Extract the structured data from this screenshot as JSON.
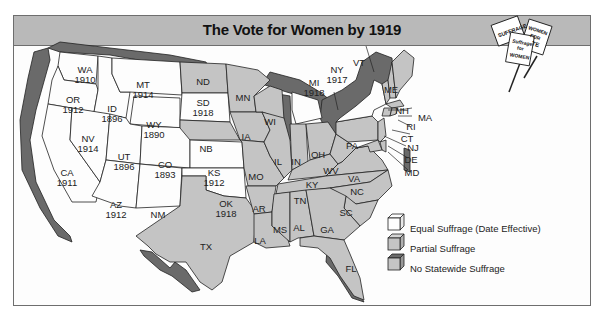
{
  "title": "The Vote for Women by 1919",
  "colors": {
    "equal": "#fdfdfd",
    "partial": "#c4c4c4",
    "none": "#6a6a6a",
    "title_bar": "#b9b9b9",
    "border": "#6e6e6e"
  },
  "signs": [
    "SUFFRAGE",
    "WOMEN FOR VOTE",
    "Suffrage for WOMEN"
  ],
  "legend": [
    {
      "key": "equal",
      "label": "Equal Suffrage (Date Effective)"
    },
    {
      "key": "partial",
      "label": "Partial Suffrage"
    },
    {
      "key": "none",
      "label": "No Statewide Suffrage"
    }
  ],
  "states": [
    {
      "abbr": "WA",
      "year": "1910",
      "status": "equal"
    },
    {
      "abbr": "OR",
      "year": "1912",
      "status": "equal"
    },
    {
      "abbr": "CA",
      "year": "1911",
      "status": "equal"
    },
    {
      "abbr": "ID",
      "year": "1896",
      "status": "equal"
    },
    {
      "abbr": "NV",
      "year": "1914",
      "status": "equal"
    },
    {
      "abbr": "MT",
      "year": "1914",
      "status": "equal"
    },
    {
      "abbr": "WY",
      "year": "1890",
      "status": "equal"
    },
    {
      "abbr": "UT",
      "year": "1896",
      "status": "equal"
    },
    {
      "abbr": "CO",
      "year": "1893",
      "status": "equal"
    },
    {
      "abbr": "AZ",
      "year": "1912",
      "status": "equal"
    },
    {
      "abbr": "NM",
      "year": "",
      "status": "partial"
    },
    {
      "abbr": "ND",
      "year": "",
      "status": "partial"
    },
    {
      "abbr": "SD",
      "year": "1918",
      "status": "equal"
    },
    {
      "abbr": "NB",
      "year": "",
      "status": "partial"
    },
    {
      "abbr": "KS",
      "year": "1912",
      "status": "equal"
    },
    {
      "abbr": "OK",
      "year": "1918",
      "status": "equal"
    },
    {
      "abbr": "TX",
      "year": "",
      "status": "partial"
    },
    {
      "abbr": "MN",
      "year": "",
      "status": "partial"
    },
    {
      "abbr": "IA",
      "year": "",
      "status": "partial"
    },
    {
      "abbr": "MO",
      "year": "",
      "status": "partial"
    },
    {
      "abbr": "AR",
      "year": "",
      "status": "partial"
    },
    {
      "abbr": "LA",
      "year": "",
      "status": "partial"
    },
    {
      "abbr": "WI",
      "year": "",
      "status": "partial"
    },
    {
      "abbr": "IL",
      "year": "",
      "status": "partial"
    },
    {
      "abbr": "MI",
      "year": "1918",
      "status": "equal"
    },
    {
      "abbr": "IN",
      "year": "",
      "status": "partial"
    },
    {
      "abbr": "OH",
      "year": "",
      "status": "partial"
    },
    {
      "abbr": "KY",
      "year": "",
      "status": "partial"
    },
    {
      "abbr": "TN",
      "year": "",
      "status": "partial"
    },
    {
      "abbr": "MS",
      "year": "",
      "status": "partial"
    },
    {
      "abbr": "AL",
      "year": "",
      "status": "partial"
    },
    {
      "abbr": "GA",
      "year": "",
      "status": "partial"
    },
    {
      "abbr": "FL",
      "year": "",
      "status": "partial"
    },
    {
      "abbr": "SC",
      "year": "",
      "status": "partial"
    },
    {
      "abbr": "NC",
      "year": "",
      "status": "partial"
    },
    {
      "abbr": "VA",
      "year": "",
      "status": "partial"
    },
    {
      "abbr": "WV",
      "year": "",
      "status": "partial"
    },
    {
      "abbr": "PA",
      "year": "",
      "status": "partial"
    },
    {
      "abbr": "NY",
      "year": "1917",
      "status": "equal"
    },
    {
      "abbr": "VT",
      "year": "",
      "status": "partial"
    },
    {
      "abbr": "NH",
      "year": "",
      "status": "partial"
    },
    {
      "abbr": "ME",
      "year": "",
      "status": "partial"
    },
    {
      "abbr": "MA",
      "year": "",
      "status": "partial"
    },
    {
      "abbr": "RI",
      "year": "",
      "status": "partial"
    },
    {
      "abbr": "CT",
      "year": "",
      "status": "partial"
    },
    {
      "abbr": "NJ",
      "year": "",
      "status": "partial"
    },
    {
      "abbr": "DE",
      "year": "",
      "status": "partial"
    },
    {
      "abbr": "MD",
      "year": "",
      "status": "partial"
    }
  ]
}
